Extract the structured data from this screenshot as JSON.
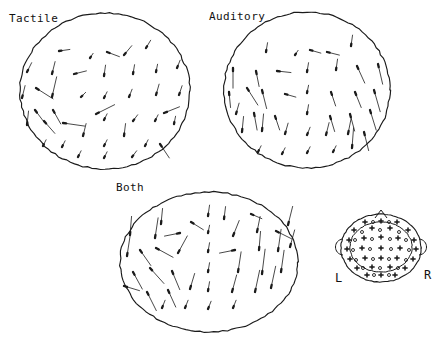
{
  "figure": {
    "type": "vector-field-scalp-maps",
    "background": "#ffffff",
    "ink_color": "#1a1a1a",
    "canvas": {
      "width": 441,
      "height": 344
    }
  },
  "panels": [
    {
      "id": "tactile",
      "label": "Tactile",
      "label_pos": {
        "x": 9,
        "y": 12
      },
      "ellipse": {
        "cx": 105,
        "cy": 91,
        "rx": 85,
        "ry": 78
      },
      "vectors": [
        {
          "x": 59,
          "y": 51,
          "dx": 7,
          "dy": -1
        },
        {
          "x": 90,
          "y": 58,
          "dx": 2,
          "dy": -3
        },
        {
          "x": 107,
          "y": 52,
          "dx": 8,
          "dy": 3
        },
        {
          "x": 124,
          "y": 55,
          "dx": 5,
          "dy": -6
        },
        {
          "x": 146,
          "y": 48,
          "dx": 3,
          "dy": -5
        },
        {
          "x": 27,
          "y": 72,
          "dx": 3,
          "dy": -6
        },
        {
          "x": 52,
          "y": 74,
          "dx": 2,
          "dy": -8
        },
        {
          "x": 74,
          "y": 74,
          "dx": 8,
          "dy": -2
        },
        {
          "x": 104,
          "y": 76,
          "dx": 1,
          "dy": -7
        },
        {
          "x": 133,
          "y": 74,
          "dx": 1,
          "dy": -6
        },
        {
          "x": 156,
          "y": 72,
          "dx": 1,
          "dy": -5
        },
        {
          "x": 177,
          "y": 68,
          "dx": 2,
          "dy": -5
        },
        {
          "x": 36,
          "y": 88,
          "dx": 11,
          "dy": 7
        },
        {
          "x": 22,
          "y": 98,
          "dx": 2,
          "dy": -8
        },
        {
          "x": 52,
          "y": 97,
          "dx": 3,
          "dy": -13
        },
        {
          "x": 81,
          "y": 97,
          "dx": 3,
          "dy": -3
        },
        {
          "x": 104,
          "y": 98,
          "dx": 2,
          "dy": -4
        },
        {
          "x": 129,
          "y": 97,
          "dx": 2,
          "dy": -5
        },
        {
          "x": 156,
          "y": 95,
          "dx": 2,
          "dy": -7
        },
        {
          "x": 179,
          "y": 95,
          "dx": 2,
          "dy": -6
        },
        {
          "x": 35,
          "y": 110,
          "dx": 6,
          "dy": 8
        },
        {
          "x": 53,
          "y": 110,
          "dx": 5,
          "dy": 9
        },
        {
          "x": 96,
          "y": 114,
          "dx": 12,
          "dy": -6
        },
        {
          "x": 164,
          "y": 113,
          "dx": 10,
          "dy": -4
        },
        {
          "x": 27,
          "y": 125,
          "dx": 1,
          "dy": -9
        },
        {
          "x": 44,
          "y": 121,
          "dx": 7,
          "dy": 8
        },
        {
          "x": 63,
          "y": 123,
          "dx": 14,
          "dy": 2
        },
        {
          "x": 104,
          "y": 120,
          "dx": 2,
          "dy": -4
        },
        {
          "x": 133,
          "y": 121,
          "dx": 3,
          "dy": -4
        },
        {
          "x": 155,
          "y": 121,
          "dx": 2,
          "dy": -4
        },
        {
          "x": 174,
          "y": 124,
          "dx": 1,
          "dy": -5
        },
        {
          "x": 83,
          "y": 136,
          "dx": 2,
          "dy": -8
        },
        {
          "x": 124,
          "y": 136,
          "dx": 1,
          "dy": -8
        },
        {
          "x": 43,
          "y": 146,
          "dx": 2,
          "dy": -4
        },
        {
          "x": 62,
          "y": 147,
          "dx": 2,
          "dy": -4
        },
        {
          "x": 104,
          "y": 146,
          "dx": 2,
          "dy": -4
        },
        {
          "x": 145,
          "y": 146,
          "dx": 2,
          "dy": -4
        },
        {
          "x": 160,
          "y": 144,
          "dx": 6,
          "dy": 9
        },
        {
          "x": 78,
          "y": 157,
          "dx": 2,
          "dy": -4
        },
        {
          "x": 104,
          "y": 158,
          "dx": 2,
          "dy": -4
        },
        {
          "x": 132,
          "y": 157,
          "dx": 3,
          "dy": -4
        }
      ]
    },
    {
      "id": "auditory",
      "label": "Auditory",
      "label_pos": {
        "x": 209,
        "y": 10
      },
      "ellipse": {
        "cx": 307,
        "cy": 90,
        "rx": 83,
        "ry": 78
      },
      "vectors": [
        {
          "x": 266,
          "y": 52,
          "dx": 1,
          "dy": -6
        },
        {
          "x": 295,
          "y": 55,
          "dx": 2,
          "dy": -3
        },
        {
          "x": 310,
          "y": 50,
          "dx": 7,
          "dy": 2
        },
        {
          "x": 327,
          "y": 52,
          "dx": 8,
          "dy": 2
        },
        {
          "x": 351,
          "y": 46,
          "dx": 1,
          "dy": -7
        },
        {
          "x": 233,
          "y": 68,
          "dx": 0,
          "dy": 13
        },
        {
          "x": 256,
          "y": 71,
          "dx": 2,
          "dy": 10
        },
        {
          "x": 277,
          "y": 71,
          "dx": 9,
          "dy": 1
        },
        {
          "x": 307,
          "y": 72,
          "dx": 1,
          "dy": -6
        },
        {
          "x": 336,
          "y": 70,
          "dx": 1,
          "dy": -7
        },
        {
          "x": 357,
          "y": 66,
          "dx": 5,
          "dy": 11
        },
        {
          "x": 378,
          "y": 64,
          "dx": 3,
          "dy": 13
        },
        {
          "x": 229,
          "y": 92,
          "dx": 1,
          "dy": 10
        },
        {
          "x": 247,
          "y": 88,
          "dx": 7,
          "dy": 11
        },
        {
          "x": 262,
          "y": 90,
          "dx": 3,
          "dy": 12
        },
        {
          "x": 285,
          "y": 94,
          "dx": 7,
          "dy": 2
        },
        {
          "x": 307,
          "y": 93,
          "dx": 1,
          "dy": -5
        },
        {
          "x": 331,
          "y": 92,
          "dx": 3,
          "dy": 9
        },
        {
          "x": 355,
          "y": 92,
          "dx": 4,
          "dy": 10
        },
        {
          "x": 374,
          "y": 90,
          "dx": 4,
          "dy": 14
        },
        {
          "x": 236,
          "y": 114,
          "dx": 2,
          "dy": -7
        },
        {
          "x": 254,
          "y": 113,
          "dx": 2,
          "dy": 11
        },
        {
          "x": 275,
          "y": 116,
          "dx": 3,
          "dy": 9
        },
        {
          "x": 307,
          "y": 114,
          "dx": 1,
          "dy": -6
        },
        {
          "x": 330,
          "y": 116,
          "dx": 3,
          "dy": 10
        },
        {
          "x": 350,
          "y": 114,
          "dx": 3,
          "dy": 11
        },
        {
          "x": 370,
          "y": 110,
          "dx": 4,
          "dy": 13
        },
        {
          "x": 242,
          "y": 132,
          "dx": 1,
          "dy": -10
        },
        {
          "x": 262,
          "y": 131,
          "dx": 1,
          "dy": -11
        },
        {
          "x": 285,
          "y": 134,
          "dx": 2,
          "dy": -7
        },
        {
          "x": 307,
          "y": 135,
          "dx": 2,
          "dy": -5
        },
        {
          "x": 326,
          "y": 135,
          "dx": 2,
          "dy": -8
        },
        {
          "x": 348,
          "y": 134,
          "dx": 2,
          "dy": -10
        },
        {
          "x": 364,
          "y": 132,
          "dx": 3,
          "dy": 12
        },
        {
          "x": 258,
          "y": 152,
          "dx": 2,
          "dy": -4
        },
        {
          "x": 282,
          "y": 154,
          "dx": 2,
          "dy": -4
        },
        {
          "x": 307,
          "y": 153,
          "dx": 2,
          "dy": -4
        },
        {
          "x": 333,
          "y": 152,
          "dx": 2,
          "dy": -4
        },
        {
          "x": 352,
          "y": 148,
          "dx": 1,
          "dy": -13
        }
      ]
    },
    {
      "id": "both",
      "label": "Both",
      "label_pos": {
        "x": 116,
        "y": 181
      },
      "ellipse": {
        "cx": 209,
        "cy": 262,
        "rx": 89,
        "ry": 70
      },
      "vectors": [
        {
          "x": 161,
          "y": 224,
          "dx": 1,
          "dy": -10
        },
        {
          "x": 191,
          "y": 222,
          "dx": 8,
          "dy": 5
        },
        {
          "x": 208,
          "y": 216,
          "dx": 1,
          "dy": -7
        },
        {
          "x": 224,
          "y": 219,
          "dx": 1,
          "dy": -8
        },
        {
          "x": 251,
          "y": 214,
          "dx": 7,
          "dy": 3
        },
        {
          "x": 130,
          "y": 235,
          "dx": 1,
          "dy": -12
        },
        {
          "x": 155,
          "y": 238,
          "dx": 2,
          "dy": -13
        },
        {
          "x": 180,
          "y": 233,
          "dx": -10,
          "dy": 2
        },
        {
          "x": 208,
          "y": 233,
          "dx": 1,
          "dy": -5
        },
        {
          "x": 233,
          "y": 236,
          "dx": 4,
          "dy": -10
        },
        {
          "x": 257,
          "y": 232,
          "dx": 2,
          "dy": -10
        },
        {
          "x": 276,
          "y": 231,
          "dx": 10,
          "dy": 5
        },
        {
          "x": 288,
          "y": 225,
          "dx": 3,
          "dy": -12
        },
        {
          "x": 140,
          "y": 250,
          "dx": 7,
          "dy": 10
        },
        {
          "x": 127,
          "y": 256,
          "dx": 2,
          "dy": -13
        },
        {
          "x": 156,
          "y": 248,
          "dx": 11,
          "dy": 6
        },
        {
          "x": 178,
          "y": 253,
          "dx": 6,
          "dy": -11
        },
        {
          "x": 208,
          "y": 252,
          "dx": 1,
          "dy": -6
        },
        {
          "x": 235,
          "y": 250,
          "dx": -10,
          "dy": 2
        },
        {
          "x": 259,
          "y": 250,
          "dx": 1,
          "dy": -12
        },
        {
          "x": 278,
          "y": 251,
          "dx": 2,
          "dy": -14
        },
        {
          "x": 290,
          "y": 247,
          "dx": 3,
          "dy": -11
        },
        {
          "x": 133,
          "y": 272,
          "dx": 6,
          "dy": 11
        },
        {
          "x": 150,
          "y": 268,
          "dx": 9,
          "dy": 10
        },
        {
          "x": 172,
          "y": 271,
          "dx": 5,
          "dy": 12
        },
        {
          "x": 208,
          "y": 272,
          "dx": 1,
          "dy": -6
        },
        {
          "x": 238,
          "y": 272,
          "dx": 2,
          "dy": -13
        },
        {
          "x": 262,
          "y": 274,
          "dx": 2,
          "dy": -16
        },
        {
          "x": 281,
          "y": 272,
          "dx": 2,
          "dy": -14
        },
        {
          "x": 124,
          "y": 286,
          "dx": 10,
          "dy": 3
        },
        {
          "x": 147,
          "y": 292,
          "dx": 6,
          "dy": 12
        },
        {
          "x": 168,
          "y": 290,
          "dx": 5,
          "dy": 11
        },
        {
          "x": 190,
          "y": 289,
          "dx": 3,
          "dy": -10
        },
        {
          "x": 208,
          "y": 291,
          "dx": 1,
          "dy": -6
        },
        {
          "x": 232,
          "y": 292,
          "dx": 3,
          "dy": -11
        },
        {
          "x": 255,
          "y": 292,
          "dx": 3,
          "dy": -14
        },
        {
          "x": 271,
          "y": 288,
          "dx": 3,
          "dy": -14
        },
        {
          "x": 162,
          "y": 308,
          "dx": 2,
          "dy": -5
        },
        {
          "x": 185,
          "y": 308,
          "dx": 2,
          "dy": -5
        },
        {
          "x": 208,
          "y": 309,
          "dx": 2,
          "dy": -5
        },
        {
          "x": 233,
          "y": 308,
          "dx": 2,
          "dy": -5
        }
      ]
    }
  ],
  "montage": {
    "id": "electrode-montage",
    "left_label": "L",
    "right_label": "R",
    "head": {
      "cx": 381,
      "cy": 248,
      "rx": 40,
      "ry": 34
    },
    "inner": {
      "cx": 381,
      "cy": 247,
      "rx": 31,
      "ry": 25
    },
    "nose": {
      "x": 381,
      "y": 210
    },
    "electrode_count": 64,
    "electrodes_cross": [
      {
        "x": 365,
        "y": 222
      },
      {
        "x": 381,
        "y": 221
      },
      {
        "x": 397,
        "y": 222
      },
      {
        "x": 354,
        "y": 230
      },
      {
        "x": 372,
        "y": 228
      },
      {
        "x": 390,
        "y": 228
      },
      {
        "x": 408,
        "y": 230
      },
      {
        "x": 349,
        "y": 240
      },
      {
        "x": 364,
        "y": 238
      },
      {
        "x": 381,
        "y": 237
      },
      {
        "x": 398,
        "y": 238
      },
      {
        "x": 414,
        "y": 240
      },
      {
        "x": 347,
        "y": 249
      },
      {
        "x": 362,
        "y": 248
      },
      {
        "x": 381,
        "y": 248
      },
      {
        "x": 400,
        "y": 248
      },
      {
        "x": 416,
        "y": 249
      },
      {
        "x": 350,
        "y": 259
      },
      {
        "x": 365,
        "y": 258
      },
      {
        "x": 381,
        "y": 258
      },
      {
        "x": 397,
        "y": 258
      },
      {
        "x": 413,
        "y": 259
      },
      {
        "x": 357,
        "y": 268
      },
      {
        "x": 372,
        "y": 267
      },
      {
        "x": 390,
        "y": 267
      },
      {
        "x": 405,
        "y": 268
      },
      {
        "x": 367,
        "y": 275
      },
      {
        "x": 381,
        "y": 275
      },
      {
        "x": 395,
        "y": 275
      }
    ],
    "electrodes_circle": [
      {
        "x": 373,
        "y": 222
      },
      {
        "x": 389,
        "y": 222
      },
      {
        "x": 362,
        "y": 232
      },
      {
        "x": 380,
        "y": 230
      },
      {
        "x": 399,
        "y": 232
      },
      {
        "x": 355,
        "y": 240
      },
      {
        "x": 372,
        "y": 239
      },
      {
        "x": 390,
        "y": 239
      },
      {
        "x": 406,
        "y": 240
      },
      {
        "x": 353,
        "y": 250
      },
      {
        "x": 370,
        "y": 249
      },
      {
        "x": 391,
        "y": 249
      },
      {
        "x": 409,
        "y": 250
      },
      {
        "x": 356,
        "y": 260
      },
      {
        "x": 373,
        "y": 259
      },
      {
        "x": 389,
        "y": 259
      },
      {
        "x": 406,
        "y": 260
      },
      {
        "x": 363,
        "y": 268
      },
      {
        "x": 380,
        "y": 268
      },
      {
        "x": 398,
        "y": 268
      },
      {
        "x": 374,
        "y": 275
      },
      {
        "x": 389,
        "y": 275
      }
    ]
  }
}
